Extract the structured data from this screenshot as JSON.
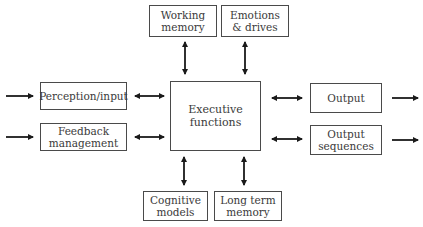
{
  "diagram": {
    "nodes": {
      "working_memory": "Working\nmemory",
      "emotions_drives": "Emotions\n& drives",
      "perception_input": "Perception/input",
      "feedback_management": "Feedback\nmanagement",
      "executive_functions": "Executive\nfunctions",
      "output": "Output",
      "output_sequences": "Output\nsequences",
      "cognitive_models": "Cognitive\nmodels",
      "long_term_memory": "Long term\nmemory"
    },
    "edges": [
      {
        "from": "external",
        "to": "perception_input",
        "type": "one-way"
      },
      {
        "from": "external",
        "to": "feedback_management",
        "type": "one-way"
      },
      {
        "from": "perception_input",
        "to": "executive_functions",
        "type": "two-way"
      },
      {
        "from": "feedback_management",
        "to": "executive_functions",
        "type": "two-way"
      },
      {
        "from": "working_memory",
        "to": "executive_functions",
        "type": "two-way"
      },
      {
        "from": "emotions_drives",
        "to": "executive_functions",
        "type": "two-way"
      },
      {
        "from": "cognitive_models",
        "to": "executive_functions",
        "type": "two-way"
      },
      {
        "from": "long_term_memory",
        "to": "executive_functions",
        "type": "two-way"
      },
      {
        "from": "executive_functions",
        "to": "output",
        "type": "two-way"
      },
      {
        "from": "executive_functions",
        "to": "output_sequences",
        "type": "two-way"
      },
      {
        "from": "output",
        "to": "external",
        "type": "one-way"
      },
      {
        "from": "output_sequences",
        "to": "external",
        "type": "one-way"
      }
    ]
  }
}
